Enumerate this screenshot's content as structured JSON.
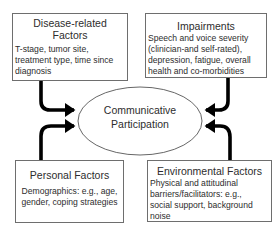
{
  "diagram": {
    "center": {
      "label_line1": "Communicative",
      "label_line2": "Participation"
    },
    "boxes": {
      "disease_related": {
        "title_line1": "Disease-related",
        "title_line2": "Factors",
        "body_lines": [
          "T-stage, tumor site,",
          "treatment type, time since",
          "diagnosis"
        ]
      },
      "impairments": {
        "title": "Impairments",
        "body_lines": [
          "Speech and voice severity",
          "(clinician-and self-rated),",
          "depression, fatigue, overall",
          "health and co-morbidities"
        ]
      },
      "personal": {
        "title": "Personal Factors",
        "body_lines": [
          "Demographics: e.g., age,",
          "gender, coping strategies"
        ]
      },
      "environmental": {
        "title": "Environmental Factors",
        "body_lines": [
          "Physical and attitudinal",
          "barriers/facilitators: e.g.,",
          "social support, background",
          "noise"
        ]
      }
    },
    "colors": {
      "arrow": "#000000",
      "box_border": "#6e6e6e",
      "ellipse_stroke": "#555555",
      "text": "#2d2d2d"
    }
  }
}
